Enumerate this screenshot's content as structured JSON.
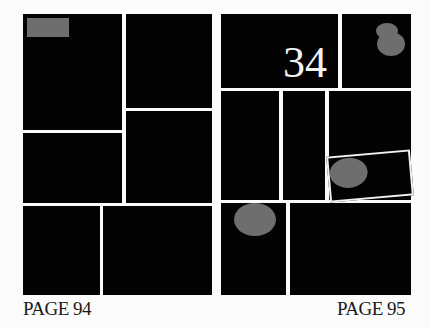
{
  "spread": {
    "left_page": {
      "label": "PAGE 94",
      "panel_count": 6,
      "caption_box_color": "#6e6e6e"
    },
    "right_page": {
      "label": "PAGE 95",
      "panel_count": 8,
      "page_number_in_panel": "34",
      "balloon_color": "#6e6e6e"
    },
    "colors": {
      "panel": "#030303",
      "gutter": "#fbfbfb",
      "label_text": "#1a1a1a",
      "number_text": "#f2f2f2"
    }
  }
}
